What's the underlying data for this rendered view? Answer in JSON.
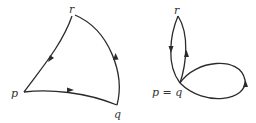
{
  "diagram_left": {
    "vertices": [
      {
        "id": "p",
        "label": "p"
      },
      {
        "id": "q",
        "label": "q"
      },
      {
        "id": "r",
        "label": "r"
      }
    ],
    "edges": [
      {
        "from": "p",
        "to": "q"
      },
      {
        "from": "q",
        "to": "r"
      },
      {
        "from": "r",
        "to": "p"
      }
    ]
  },
  "diagram_right": {
    "vertices": [
      {
        "id": "pq",
        "label": "p = q"
      },
      {
        "id": "r",
        "label": "r"
      }
    ],
    "edges": [
      {
        "from": "pq",
        "to": "r"
      },
      {
        "from": "r",
        "to": "pq"
      },
      {
        "from": "pq",
        "to": "pq",
        "type": "loop"
      }
    ]
  },
  "colors": {
    "stroke": "#2b2b2b",
    "label": "#333333",
    "background": "#ffffff"
  }
}
